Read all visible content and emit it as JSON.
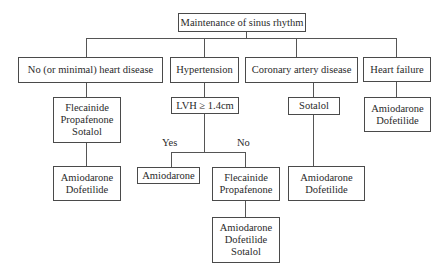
{
  "root": {
    "label": "Maintenance of sinus rhythm"
  },
  "categories": [
    {
      "label": "No (or minimal) heart disease",
      "first_line": [
        "Flecainide",
        "Propafenone",
        "Sotalol"
      ],
      "second_line": [
        "Amiodarone",
        "Dofetilide"
      ]
    },
    {
      "label": "Hypertension",
      "decision": "LVH ≥ 1.4cm",
      "branches": {
        "yes": {
          "label": "Yes",
          "drugs": [
            "Amiodarone"
          ]
        },
        "no": {
          "label": "No",
          "first_line": [
            "Flecainide",
            "Propafenone"
          ],
          "second_line": [
            "Amiodarone",
            "Dofetilide",
            "Sotalol"
          ]
        }
      }
    },
    {
      "label": "Coronary artery disease",
      "first_line": [
        "Sotalol"
      ],
      "second_line": [
        "Amiodarone",
        "Dofetilide"
      ]
    },
    {
      "label": "Heart failure",
      "first_line": [
        "Amiodarone",
        "Dofetilide"
      ]
    }
  ]
}
